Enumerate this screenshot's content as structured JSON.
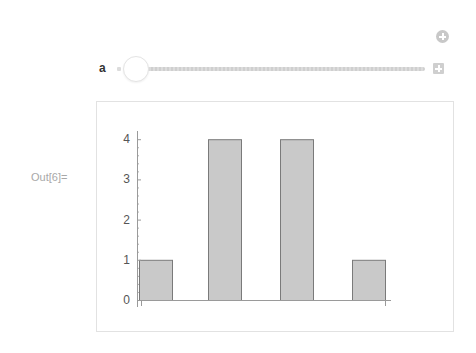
{
  "controls": {
    "add_button_icon": "circle-plus-icon",
    "variable_label": "a",
    "slider": {
      "value_position": 0,
      "min_marker": "dot",
      "expand_icon": "plus-square-icon"
    }
  },
  "output": {
    "label": "Out[6]="
  },
  "colors": {
    "bar_fill": "#c9c9c9",
    "bar_stroke": "#7a7a7a",
    "axis": "#9a9a9a",
    "frame": "#e2e2e2",
    "label_gray": "#a8a8a8"
  },
  "chart_data": {
    "type": "bar",
    "title": "",
    "xlabel": "",
    "ylabel": "",
    "categories": [
      "1",
      "2",
      "3",
      "4"
    ],
    "values": [
      1,
      4,
      4,
      1
    ],
    "ylim": [
      0,
      4.2
    ],
    "yticks": [
      0,
      1,
      2,
      3,
      4
    ],
    "grid": false,
    "legend": null
  }
}
